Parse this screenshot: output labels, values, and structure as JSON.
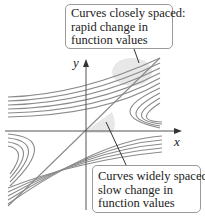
{
  "figure": {
    "axes": {
      "x_label": "x",
      "y_label": "y"
    },
    "callouts": {
      "top": {
        "lines": [
          "Curves closely spaced:",
          "rapid change in",
          "function values"
        ]
      },
      "bottom": {
        "lines": [
          "Curves widely spaced:",
          "slow change in",
          "function values"
        ]
      }
    },
    "colors": {
      "curve": "#8a8a8a",
      "axis": "#555555",
      "shade": "#e6e6e6",
      "box_border": "#9a9a9a"
    }
  }
}
